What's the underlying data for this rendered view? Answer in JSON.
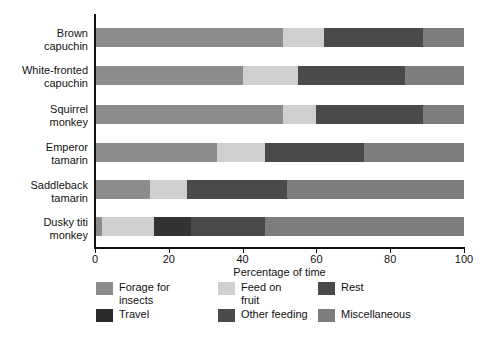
{
  "chart_data": {
    "type": "bar",
    "orientation": "horizontal",
    "stacked": true,
    "title": "",
    "xlabel": "Percentage of time",
    "ylabel": "",
    "xlim": [
      0,
      100
    ],
    "xticks": [
      0,
      20,
      40,
      60,
      80,
      100
    ],
    "grid": false,
    "legend_position": "bottom",
    "categories": [
      "Brown\ncapuchin",
      "White-fronted\ncapuchin",
      "Squirrel\nmonkey",
      "Emperor\ntamarin",
      "Saddleback\ntamarin",
      "Dusky titi\nmonkey"
    ],
    "series": [
      {
        "name": "Forage for insects",
        "color": "#8c8c8c",
        "values": [
          51,
          40,
          51,
          33,
          15,
          2
        ]
      },
      {
        "name": "Feed on fruit",
        "color": "#cfcfcf",
        "values": [
          11,
          15,
          9,
          13,
          10,
          14
        ]
      },
      {
        "name": "Rest",
        "color": "#4a4a4a",
        "values": [
          0,
          0,
          0,
          0,
          0,
          0
        ]
      },
      {
        "name": "Travel",
        "color": "#333333",
        "values": [
          0,
          0,
          0,
          0,
          0,
          10
        ]
      },
      {
        "name": "Other feeding",
        "color": "#4a4a4a",
        "values": [
          27,
          29,
          29,
          27,
          27,
          20
        ]
      },
      {
        "name": "Miscellaneous",
        "color": "#7d7d7d",
        "values": [
          11,
          16,
          11,
          27,
          48,
          54
        ]
      }
    ],
    "bars": [
      {
        "category": "Brown\ncapuchin",
        "segments": [
          {
            "label": "Forage for insects",
            "value": 51,
            "color": "#8c8c8c"
          },
          {
            "label": "Feed on fruit",
            "value": 11,
            "color": "#cfcfcf"
          },
          {
            "label": "Other feeding",
            "value": 27,
            "color": "#4a4a4a"
          },
          {
            "label": "Miscellaneous",
            "value": 11,
            "color": "#7d7d7d"
          }
        ]
      },
      {
        "category": "White-fronted\ncapuchin",
        "segments": [
          {
            "label": "Forage for insects",
            "value": 40,
            "color": "#8c8c8c"
          },
          {
            "label": "Feed on fruit",
            "value": 15,
            "color": "#cfcfcf"
          },
          {
            "label": "Other feeding",
            "value": 29,
            "color": "#4a4a4a"
          },
          {
            "label": "Miscellaneous",
            "value": 16,
            "color": "#7d7d7d"
          }
        ]
      },
      {
        "category": "Squirrel\nmonkey",
        "segments": [
          {
            "label": "Forage for insects",
            "value": 51,
            "color": "#8c8c8c"
          },
          {
            "label": "Feed on fruit",
            "value": 9,
            "color": "#cfcfcf"
          },
          {
            "label": "Other feeding",
            "value": 29,
            "color": "#4a4a4a"
          },
          {
            "label": "Miscellaneous",
            "value": 11,
            "color": "#7d7d7d"
          }
        ]
      },
      {
        "category": "Emperor\ntamarin",
        "segments": [
          {
            "label": "Forage for insects",
            "value": 33,
            "color": "#8c8c8c"
          },
          {
            "label": "Feed on fruit",
            "value": 13,
            "color": "#cfcfcf"
          },
          {
            "label": "Other feeding",
            "value": 27,
            "color": "#4a4a4a"
          },
          {
            "label": "Miscellaneous",
            "value": 27,
            "color": "#7d7d7d"
          }
        ]
      },
      {
        "category": "Saddleback\ntamarin",
        "segments": [
          {
            "label": "Forage for insects",
            "value": 15,
            "color": "#8c8c8c"
          },
          {
            "label": "Feed on fruit",
            "value": 10,
            "color": "#cfcfcf"
          },
          {
            "label": "Other feeding",
            "value": 27,
            "color": "#4a4a4a"
          },
          {
            "label": "Miscellaneous",
            "value": 48,
            "color": "#7d7d7d"
          }
        ]
      },
      {
        "category": "Dusky titi\nmonkey",
        "segments": [
          {
            "label": "Forage for insects",
            "value": 2,
            "color": "#8c8c8c"
          },
          {
            "label": "Feed on fruit",
            "value": 14,
            "color": "#cfcfcf"
          },
          {
            "label": "Travel",
            "value": 10,
            "color": "#333333"
          },
          {
            "label": "Other feeding",
            "value": 20,
            "color": "#4a4a4a"
          },
          {
            "label": "Miscellaneous",
            "value": 54,
            "color": "#7d7d7d"
          }
        ]
      }
    ]
  },
  "legend": {
    "items": [
      {
        "label": "Forage for\ninsects",
        "color": "#8c8c8c"
      },
      {
        "label": "Feed on\nfruit",
        "color": "#cfcfcf"
      },
      {
        "label": "Rest",
        "color": "#4a4a4a"
      },
      {
        "label": "Travel",
        "color": "#2b2b2b"
      },
      {
        "label": "Other feeding",
        "color": "#4a4a4a"
      },
      {
        "label": "Miscellaneous",
        "color": "#7d7d7d"
      }
    ]
  },
  "axis": {
    "x_title": "Percentage of time",
    "x_ticks": [
      "0",
      "20",
      "40",
      "60",
      "80",
      "100"
    ]
  }
}
